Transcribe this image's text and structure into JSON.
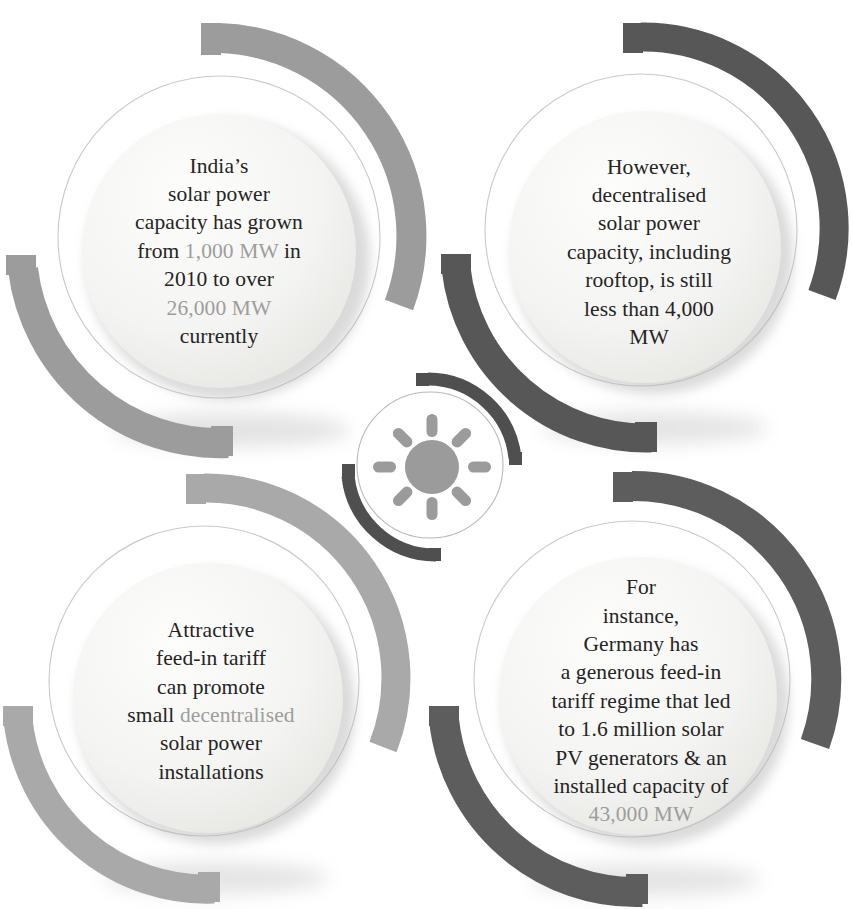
{
  "infographic": {
    "title": "Solar power capacity infographic",
    "center_icon": "sun-icon",
    "colors": {
      "background": "#ffffff",
      "arc_light": "#9c9c9c",
      "arc_light_alt": "#a9a9a9",
      "arc_dark": "#575757",
      "arc_dark_alt": "#5d5d5d",
      "inner_disc": "#f4f4f2",
      "body_text": "#242424",
      "highlight_text": "#9d9d9d",
      "sun_icon": "#9a9a9a"
    },
    "nodes": [
      {
        "id": "top-left",
        "name": "india-solar-capacity-growth",
        "arc_color": "#9c9c9c",
        "text_segments": [
          {
            "text": "India’s",
            "highlight": false,
            "break_after": true
          },
          {
            "text": "solar power",
            "highlight": false,
            "break_after": true
          },
          {
            "text": "capacity has grown",
            "highlight": false,
            "break_after": true
          },
          {
            "text": "from ",
            "highlight": false,
            "break_after": false
          },
          {
            "text": "1,000 MW",
            "highlight": true,
            "break_after": false
          },
          {
            "text": " in",
            "highlight": false,
            "break_after": true
          },
          {
            "text": "2010 to over",
            "highlight": false,
            "break_after": true
          },
          {
            "text": "26,000 MW",
            "highlight": true,
            "break_after": true
          },
          {
            "text": "currently",
            "highlight": false,
            "break_after": false
          }
        ],
        "plain_text": "India’s solar power capacity has grown from 1,000 MW in 2010 to over 26,000 MW currently"
      },
      {
        "id": "top-right",
        "name": "decentralised-capacity-limit",
        "arc_color": "#575757",
        "text_segments": [
          {
            "text": "However,",
            "highlight": false,
            "break_after": true
          },
          {
            "text": "decentralised",
            "highlight": false,
            "break_after": true
          },
          {
            "text": "solar power",
            "highlight": false,
            "break_after": true
          },
          {
            "text": "capacity, including",
            "highlight": false,
            "break_after": true
          },
          {
            "text": "rooftop, is still",
            "highlight": false,
            "break_after": true
          },
          {
            "text": "less than 4,000",
            "highlight": false,
            "break_after": true
          },
          {
            "text": "MW",
            "highlight": false,
            "break_after": false
          }
        ],
        "plain_text": "However, decentralised solar power capacity, including rooftop, is still less than 4,000 MW"
      },
      {
        "id": "bottom-left",
        "name": "feed-in-tariff-promotion",
        "arc_color": "#a9a9a9",
        "text_segments": [
          {
            "text": "Attractive",
            "highlight": false,
            "break_after": true
          },
          {
            "text": "feed-in tariff",
            "highlight": false,
            "break_after": true
          },
          {
            "text": "can promote",
            "highlight": false,
            "break_after": true
          },
          {
            "text": "small ",
            "highlight": false,
            "break_after": false
          },
          {
            "text": "decentralised",
            "highlight": true,
            "break_after": true
          },
          {
            "text": "solar power",
            "highlight": false,
            "break_after": true
          },
          {
            "text": "installations",
            "highlight": false,
            "break_after": false
          }
        ],
        "plain_text": "Attractive feed-in tariff can promote small decentralised solar power installations"
      },
      {
        "id": "bottom-right",
        "name": "germany-feed-in-tariff-example",
        "arc_color": "#5d5d5d",
        "text_segments": [
          {
            "text": "For",
            "highlight": false,
            "break_after": true
          },
          {
            "text": "instance,",
            "highlight": false,
            "break_after": true
          },
          {
            "text": "Germany has",
            "highlight": false,
            "break_after": true
          },
          {
            "text": "a generous feed-in",
            "highlight": false,
            "break_after": true
          },
          {
            "text": "tariff regime that led",
            "highlight": false,
            "break_after": true
          },
          {
            "text": "to 1.6 million solar",
            "highlight": false,
            "break_after": true
          },
          {
            "text": "PV generators & an",
            "highlight": false,
            "break_after": true
          },
          {
            "text": "installed capacity of",
            "highlight": false,
            "break_after": true
          },
          {
            "text": "43,000 MW",
            "highlight": true,
            "break_after": false
          }
        ],
        "plain_text": "For instance, Germany has a generous feed-in tariff regime that led to 1.6 million solar PV generators & an installed capacity of 43,000 MW"
      }
    ],
    "figures": {
      "india_2010_capacity": "1,000 MW",
      "india_current_capacity": "26,000 MW",
      "india_decentralised_capacity": "less than 4,000 MW",
      "germany_pv_generators": "1.6 million",
      "germany_installed_capacity": "43,000 MW"
    }
  }
}
